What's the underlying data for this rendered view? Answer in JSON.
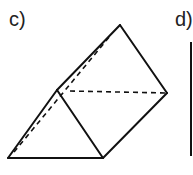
{
  "labels": {
    "c": "c)",
    "d": "d)"
  },
  "figure": {
    "type": "triangular-prism",
    "stroke": "#111111",
    "solid_edges": [
      [
        8,
        158,
        103,
        158
      ],
      [
        8,
        158,
        57,
        90
      ],
      [
        57,
        90,
        103,
        158
      ],
      [
        57,
        90,
        120,
        25
      ],
      [
        120,
        25,
        167,
        93
      ],
      [
        167,
        93,
        103,
        158
      ]
    ],
    "dashed_edges": [
      [
        14,
        152,
        110,
        36
      ],
      [
        70,
        91,
        167,
        93
      ]
    ]
  }
}
